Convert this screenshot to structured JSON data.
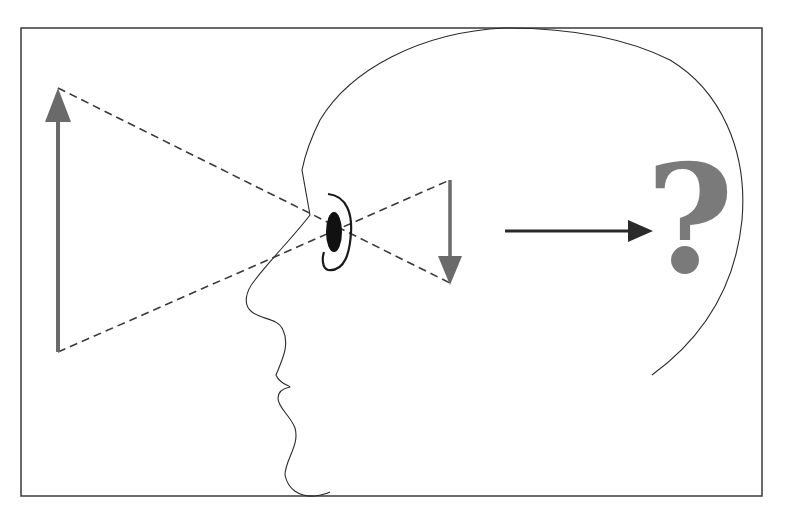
{
  "diagram": {
    "labels": {
      "question_mark": "?"
    },
    "colors": {
      "frame": "#3a3a3a",
      "object_arrow": "#6a6a6a",
      "image_arrow": "#6a6a6a",
      "perception_arrow": "#2a2a2a",
      "pupil": "#111111",
      "question_mark": "#7a7a7a",
      "background": "#ffffff"
    },
    "elements": [
      {
        "name": "object-arrow",
        "direction": "up",
        "description": "Upright object (large gray arrow)"
      },
      {
        "name": "light-rays",
        "style": "dashed",
        "description": "Rays crossing at the eye"
      },
      {
        "name": "eye",
        "description": "Eye with pupil and lens arc"
      },
      {
        "name": "retinal-image-arrow",
        "direction": "down",
        "description": "Inverted image (small gray arrow)"
      },
      {
        "name": "perception-arrow",
        "direction": "right",
        "description": "Arrow to brain"
      },
      {
        "name": "question-mark",
        "description": "Question of perception"
      }
    ]
  }
}
